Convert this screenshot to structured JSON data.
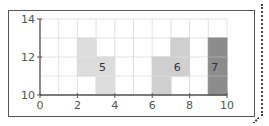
{
  "chart_data": {
    "type": "area",
    "title": "",
    "xlabel": "",
    "ylabel": "",
    "xlim": [
      0,
      10
    ],
    "ylim": [
      10,
      14
    ],
    "grid": true,
    "xticks": [
      0,
      2,
      4,
      6,
      8,
      10
    ],
    "yticks": [
      10,
      12,
      14
    ],
    "xtick_labels": [
      "0",
      "2",
      "4",
      "6",
      "8",
      "10"
    ],
    "ytick_labels": [
      "10",
      "12",
      "14"
    ],
    "shapes": [
      {
        "label": "5",
        "color": "#dcdcdc",
        "cells": [
          [
            2,
            11,
            3,
            13
          ],
          [
            3,
            10,
            4,
            12
          ]
        ],
        "label_pos": [
          3.5,
          11.5
        ]
      },
      {
        "label": "6",
        "color": "#cfcfcf",
        "cells": [
          [
            6,
            10,
            7,
            12
          ],
          [
            7,
            11,
            8,
            13
          ]
        ],
        "label_pos": [
          7.5,
          11.5
        ]
      },
      {
        "label": "7",
        "color": "#8c8c8c",
        "cells": [
          [
            9,
            10,
            10,
            13
          ]
        ],
        "label_pos": [
          9.5,
          11.5
        ]
      }
    ]
  }
}
